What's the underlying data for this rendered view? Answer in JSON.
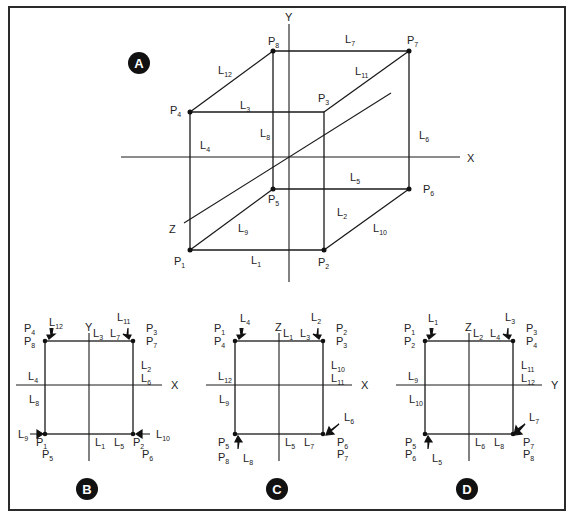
{
  "figure": {
    "panels": {
      "A": {
        "badge": "A",
        "axes": {
          "x": "X",
          "y": "Y",
          "z": "Z"
        },
        "points": [
          {
            "id": "P1",
            "base": "P",
            "sub": "1"
          },
          {
            "id": "P2",
            "base": "P",
            "sub": "2"
          },
          {
            "id": "P3",
            "base": "P",
            "sub": "3"
          },
          {
            "id": "P4",
            "base": "P",
            "sub": "4"
          },
          {
            "id": "P5",
            "base": "P",
            "sub": "5"
          },
          {
            "id": "P6",
            "base": "P",
            "sub": "6"
          },
          {
            "id": "P7",
            "base": "P",
            "sub": "7"
          },
          {
            "id": "P8",
            "base": "P",
            "sub": "8"
          }
        ],
        "edges": [
          {
            "id": "L1",
            "base": "L",
            "sub": "1",
            "from": "P1",
            "to": "P2"
          },
          {
            "id": "L2",
            "base": "L",
            "sub": "2",
            "from": "P2",
            "to": "P3"
          },
          {
            "id": "L3",
            "base": "L",
            "sub": "3",
            "from": "P3",
            "to": "P4"
          },
          {
            "id": "L4",
            "base": "L",
            "sub": "4",
            "from": "P4",
            "to": "P1"
          },
          {
            "id": "L5",
            "base": "L",
            "sub": "5",
            "from": "P5",
            "to": "P6"
          },
          {
            "id": "L6",
            "base": "L",
            "sub": "6",
            "from": "P6",
            "to": "P7"
          },
          {
            "id": "L7",
            "base": "L",
            "sub": "7",
            "from": "P7",
            "to": "P8"
          },
          {
            "id": "L8",
            "base": "L",
            "sub": "8",
            "from": "P8",
            "to": "P5"
          },
          {
            "id": "L9",
            "base": "L",
            "sub": "9",
            "from": "P1",
            "to": "P5"
          },
          {
            "id": "L10",
            "base": "L",
            "sub": "10",
            "from": "P2",
            "to": "P6"
          },
          {
            "id": "L11",
            "base": "L",
            "sub": "11",
            "from": "P3",
            "to": "P7"
          },
          {
            "id": "L12",
            "base": "L",
            "sub": "12",
            "from": "P4",
            "to": "P8"
          }
        ]
      },
      "B": {
        "badge": "B",
        "axes": {
          "horizontal": "X",
          "vertical": "Y"
        },
        "corner_labels": {
          "top_left": [
            {
              "base": "P",
              "sub": "4"
            },
            {
              "base": "P",
              "sub": "8"
            }
          ],
          "top_right": [
            {
              "base": "P",
              "sub": "3"
            },
            {
              "base": "P",
              "sub": "7"
            }
          ],
          "bottom_left": [
            {
              "base": "P",
              "sub": "1"
            },
            {
              "base": "P",
              "sub": "5"
            }
          ],
          "bottom_right": [
            {
              "base": "P",
              "sub": "2"
            },
            {
              "base": "P",
              "sub": "6"
            }
          ]
        },
        "edge_labels": {
          "top": [
            {
              "base": "L",
              "sub": "3"
            },
            {
              "base": "L",
              "sub": "7"
            }
          ],
          "left": [
            {
              "base": "L",
              "sub": "4"
            },
            {
              "base": "L",
              "sub": "8"
            }
          ],
          "right": [
            {
              "base": "L",
              "sub": "2"
            },
            {
              "base": "L",
              "sub": "6"
            }
          ],
          "bottom": [
            {
              "base": "L",
              "sub": "1"
            },
            {
              "base": "L",
              "sub": "5"
            }
          ]
        },
        "arrow_labels": {
          "top_left": {
            "base": "L",
            "sub": "12"
          },
          "top_right": {
            "base": "L",
            "sub": "11"
          },
          "bottom_left": {
            "base": "L",
            "sub": "9"
          },
          "bottom_right": {
            "base": "L",
            "sub": "10"
          }
        }
      },
      "C": {
        "badge": "C",
        "axes": {
          "horizontal": "X",
          "vertical": "Z"
        },
        "corner_labels": {
          "top_left": [
            {
              "base": "P",
              "sub": "1"
            },
            {
              "base": "P",
              "sub": "4"
            }
          ],
          "top_right": [
            {
              "base": "P",
              "sub": "2"
            },
            {
              "base": "P",
              "sub": "3"
            }
          ],
          "bottom_left": [
            {
              "base": "P",
              "sub": "5"
            },
            {
              "base": "P",
              "sub": "8"
            }
          ],
          "bottom_right": [
            {
              "base": "P",
              "sub": "6"
            },
            {
              "base": "P",
              "sub": "7"
            }
          ]
        },
        "edge_labels": {
          "top": [
            {
              "base": "L",
              "sub": "1"
            },
            {
              "base": "L",
              "sub": "3"
            }
          ],
          "left": [
            {
              "base": "L",
              "sub": "12"
            },
            {
              "base": "L",
              "sub": "9"
            }
          ],
          "right": [
            {
              "base": "L",
              "sub": "10"
            },
            {
              "base": "L",
              "sub": "11"
            }
          ],
          "bottom": [
            {
              "base": "L",
              "sub": "5"
            },
            {
              "base": "L",
              "sub": "7"
            }
          ]
        },
        "arrow_labels": {
          "top_left": {
            "base": "L",
            "sub": "4"
          },
          "top_right": {
            "base": "L",
            "sub": "2"
          },
          "bottom_left": {
            "base": "L",
            "sub": "8"
          },
          "bottom_right": {
            "base": "L",
            "sub": "6"
          }
        }
      },
      "D": {
        "badge": "D",
        "axes": {
          "horizontal": "Y",
          "vertical": "Z"
        },
        "corner_labels": {
          "top_left": [
            {
              "base": "P",
              "sub": "1"
            },
            {
              "base": "P",
              "sub": "2"
            }
          ],
          "top_right": [
            {
              "base": "P",
              "sub": "3"
            },
            {
              "base": "P",
              "sub": "4"
            }
          ],
          "bottom_left": [
            {
              "base": "P",
              "sub": "5"
            },
            {
              "base": "P",
              "sub": "6"
            }
          ],
          "bottom_right": [
            {
              "base": "P",
              "sub": "7"
            },
            {
              "base": "P",
              "sub": "8"
            }
          ]
        },
        "edge_labels": {
          "top": [
            {
              "base": "L",
              "sub": "2"
            },
            {
              "base": "L",
              "sub": "4"
            }
          ],
          "left": [
            {
              "base": "L",
              "sub": "9"
            },
            {
              "base": "L",
              "sub": "10"
            }
          ],
          "right": [
            {
              "base": "L",
              "sub": "11"
            },
            {
              "base": "L",
              "sub": "12"
            }
          ],
          "bottom": [
            {
              "base": "L",
              "sub": "6"
            },
            {
              "base": "L",
              "sub": "8"
            }
          ]
        },
        "arrow_labels": {
          "top_left": {
            "base": "L",
            "sub": "1"
          },
          "top_right": {
            "base": "L",
            "sub": "3"
          },
          "bottom_left": {
            "base": "L",
            "sub": "5"
          },
          "bottom_right": {
            "base": "L",
            "sub": "7"
          }
        }
      }
    }
  }
}
